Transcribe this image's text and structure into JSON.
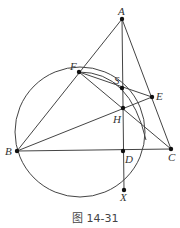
{
  "figure": {
    "caption": "图 14-31",
    "line_color": "#444444",
    "point_color": "#111111"
  },
  "points": {
    "A": {
      "label": "A",
      "x": 122,
      "y": 19
    },
    "F": {
      "label": "F",
      "x": 79,
      "y": 72
    },
    "S": {
      "label": "S",
      "x": 122,
      "y": 88
    },
    "E": {
      "label": "E",
      "x": 152,
      "y": 97
    },
    "H": {
      "label": "H",
      "x": 123,
      "y": 108
    },
    "B": {
      "label": "B",
      "x": 17,
      "y": 151
    },
    "D": {
      "label": "D",
      "x": 123,
      "y": 151
    },
    "C": {
      "label": "C",
      "x": 171,
      "y": 149
    },
    "X": {
      "label": "X",
      "x": 124,
      "y": 190
    }
  },
  "circle": {
    "cx": 80,
    "cy": 132,
    "r": 65,
    "through": [
      "B",
      "F",
      "X"
    ]
  },
  "segments": [
    [
      "A",
      "B"
    ],
    [
      "A",
      "C"
    ],
    [
      "A",
      "X"
    ],
    [
      "B",
      "C"
    ],
    [
      "B",
      "E"
    ],
    [
      "F",
      "C"
    ],
    [
      "F",
      "E"
    ],
    [
      "F",
      "S"
    ],
    [
      "B",
      "H"
    ]
  ]
}
